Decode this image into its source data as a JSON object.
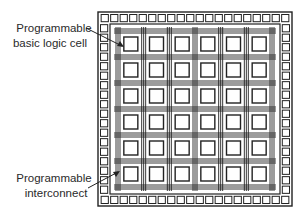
{
  "diagram": {
    "grid": {
      "rows": 6,
      "cols": 6
    },
    "io_pads": {
      "top": 20,
      "bottom": 20,
      "left": 20,
      "right": 20
    },
    "interconnect_lines_per_channel": 3,
    "labels": {
      "logic_cell": [
        "Programmable",
        "basic logic cell"
      ],
      "interconnect": [
        "Programmable",
        "interconnect"
      ]
    },
    "colors": {
      "ink": "#222222",
      "background": "#ffffff"
    }
  }
}
